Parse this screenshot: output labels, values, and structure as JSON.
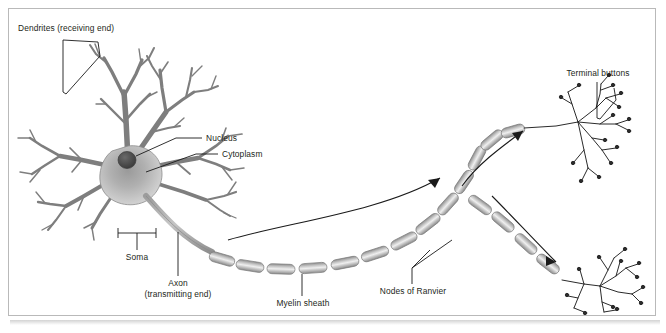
{
  "figure": {
    "kind": "neuron-anatomy-diagram",
    "background_color": "#ffffff",
    "frame_color": "#b9b9b9",
    "ink_color": "#231f20",
    "cell_fill_light": "#d8d8d8",
    "cell_fill_mid": "#a8a8a8",
    "cell_fill_dark": "#6f6f6f",
    "nucleus_color": "#4a4a4a"
  },
  "labels": {
    "dendrites": "Dendrites (receiving end)",
    "nucleus": "Nucleus",
    "cytoplasm": "Cytoplasm",
    "soma": "Soma",
    "axon_line1": "Axon",
    "axon_line2": "(transmitting end)",
    "myelin": "Myelin sheath",
    "nodes": "Nodes of Ranvier",
    "terminal": "Terminal buttons"
  },
  "parts": [
    {
      "id": "dendrites",
      "label": "Dendrites (receiving end)",
      "connector": "quadrilateral-bracket"
    },
    {
      "id": "nucleus",
      "label": "Nucleus",
      "connector": "leader-line"
    },
    {
      "id": "cytoplasm",
      "label": "Cytoplasm",
      "connector": "leader-line"
    },
    {
      "id": "soma",
      "label": "Soma",
      "connector": "square-bracket"
    },
    {
      "id": "axon",
      "label": "Axon (transmitting end)",
      "connector": "leader-line"
    },
    {
      "id": "myelin-sheath",
      "label": "Myelin sheath",
      "connector": "leader-line"
    },
    {
      "id": "nodes-of-ranvier",
      "label": "Nodes of Ranvier",
      "connector": "forked-leader-line"
    },
    {
      "id": "terminal-buttons",
      "label": "Terminal buttons",
      "connector": "v-bracket"
    }
  ],
  "signal_arrows": 3
}
